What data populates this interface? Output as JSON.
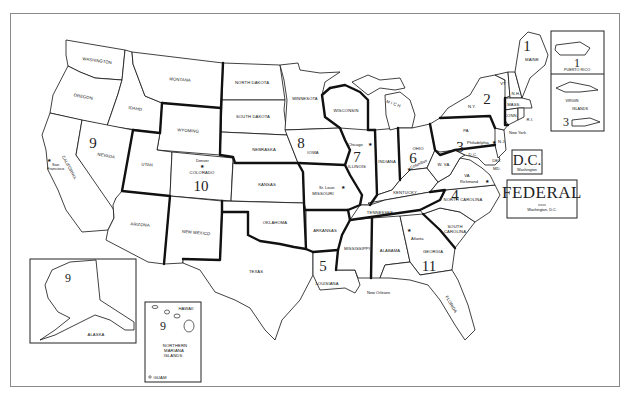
{
  "map": {
    "title": "Federal Regions Map",
    "states": {
      "washington": "WASHINGTON",
      "oregon": "OREGON",
      "idaho": "IDAHO",
      "montana": "MONTANA",
      "wyoming": "WYOMING",
      "california": "CALIFORNIA",
      "nevada": "NEVADA",
      "utah": "UTAH",
      "colorado": "COLORADO",
      "arizona": "ARIZONA",
      "new_mexico": "NEW MEXICO",
      "north_dakota": "NORTH DAKOTA",
      "south_dakota": "SOUTH DAKOTA",
      "nebraska": "NEBRASKA",
      "kansas": "KANSAS",
      "oklahoma": "OKLAHOMA",
      "texas": "TEXAS",
      "minnesota": "MINNESOTA",
      "iowa": "IOWA",
      "missouri": "MISSOURI",
      "arkansas": "ARKANSAS",
      "louisiana": "LOUISIANA",
      "wisconsin": "WISCONSIN",
      "illinois": "ILLINOIS",
      "indiana": "INDIANA",
      "michigan": "M I C H",
      "ohio": "OHIO",
      "kentucky": "KENTUCKY",
      "tennessee": "TENNESSEE",
      "mississippi": "MISSISSIPPI",
      "alabama": "ALABAMA",
      "georgia": "GEORGIA",
      "florida": "FLORIDA",
      "south_carolina_1": "SOUTH",
      "south_carolina_2": "CAROLINA",
      "north_carolina": "NORTH CAROLINA",
      "virginia": "VA",
      "west_virginia": "W. VA.",
      "pennsylvania": "PA",
      "new_york": "N.Y.",
      "vermont": "VT",
      "new_hampshire": "N.H.",
      "maine": "MAINE",
      "massachusetts": "MASS.",
      "connecticut": "CONN.",
      "rhode_island": "R.I.",
      "new_jersey": "N.J.",
      "delaware": "DEL.",
      "maryland": "MD.",
      "dc_small": "D.C.",
      "alaska": "ALASKA",
      "hawaii": "HAWAII",
      "northern_mariana_1": "NORTHERN",
      "northern_mariana_2": "MARIANA",
      "northern_mariana_3": "ISLANDS",
      "guam": "GUAM",
      "puerto_rico": "PUERTO RICO",
      "virgin_islands_1": "VIRGIN",
      "virgin_islands_2": "ISLANDS"
    },
    "cities": {
      "san_francisco_1": "San",
      "san_francisco_2": "Francisco",
      "denver": "Denver",
      "chicago": "Chicago",
      "st_louis": "St. Louis",
      "columbus": "Columbus",
      "philadelphia": "Philadelphia",
      "new_york": "New York",
      "richmond": "Richmond",
      "atlanta": "Atlanta",
      "new_orleans": "New Orleans"
    },
    "regions": {
      "r1": "1",
      "r1_pr": "1",
      "r2": "2",
      "r3": "3",
      "r3_vi": "3",
      "r4": "4",
      "r5": "5",
      "r6": "6",
      "r7": "7",
      "r8": "8",
      "r9": "9",
      "r9_ak": "9",
      "r9_hi": "9",
      "r10": "10",
      "r11": "11"
    },
    "dc_box": {
      "title": "D.C.",
      "subtitle": "Washington"
    },
    "federal_box": {
      "title": "FEDERAL",
      "subtitle": "Washington, D.C."
    },
    "star_glyph": "★"
  }
}
